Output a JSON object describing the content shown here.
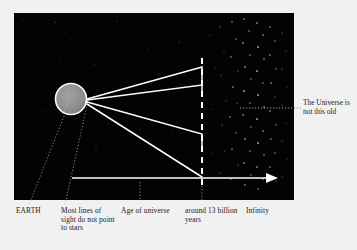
{
  "figure": {
    "panel_background": "#030303",
    "page_background": "#f1f1f1",
    "ink_color": "#ffffff",
    "text_color": "#1b1b1b",
    "earth": {
      "label": "EARTH",
      "fill": "#8c8c8c",
      "stroke": "#ffffff",
      "center_x": 71,
      "center_y": 99,
      "radius": 15
    },
    "axis": {
      "name": "time-axis",
      "start_x": 72,
      "end_x": 272,
      "y": 178,
      "arrowhead": true
    },
    "dashed_line": {
      "name": "age-of-universe-boundary",
      "x": 202,
      "y_top": 58,
      "y_bottom": 185,
      "style": "dashed"
    },
    "sight_lines": [
      {
        "name": "sight-line-1",
        "from_x": 87,
        "from_y": 99,
        "to_x": 202,
        "to_y": 67,
        "tick_to_y": 80
      },
      {
        "name": "sight-line-2",
        "from_x": 87,
        "from_y": 99,
        "to_x": 202,
        "to_y": 85,
        "tick_to_y": 92
      },
      {
        "name": "sight-line-3",
        "from_x": 87,
        "from_y": 102,
        "to_x": 202,
        "to_y": 134,
        "tick_to_y": 146
      },
      {
        "name": "sight-line-4",
        "from_x": 87,
        "from_y": 104,
        "to_x": 202,
        "to_y": 177,
        "tick_to_y": 177
      }
    ],
    "starfield": {
      "sparse_description": "faint scattered stars across the dark panel",
      "dense_band_description": "dense cluster of stars beyond the age-of-universe boundary",
      "dense_band_start_x": 216,
      "dense_band_end_x": 278
    },
    "leaders": [
      {
        "name": "leader-earth",
        "x1": 70,
        "y1": 101,
        "x2": 31,
        "y2": 202
      },
      {
        "name": "leader-sight",
        "x1": 88,
        "y1": 101,
        "x2": 66,
        "y2": 202
      },
      {
        "name": "leader-age",
        "x1": 140,
        "y1": 182,
        "x2": 140,
        "y2": 202
      },
      {
        "name": "leader-around13",
        "x1": 202,
        "y1": 186,
        "x2": 202,
        "y2": 202
      },
      {
        "name": "leader-note",
        "x1": 240,
        "y1": 108,
        "x2": 300,
        "y2": 108
      }
    ]
  },
  "captions": {
    "earth": "EARTH",
    "most_lines_of_sight": "Most lines of sight do not point to stars",
    "age_of_universe": "Age of universe",
    "around_13_billion_years": "around 13 billion years",
    "infinity": "Infinity"
  },
  "annotations": {
    "universe_not_this_old": "The Universe is not this old"
  }
}
